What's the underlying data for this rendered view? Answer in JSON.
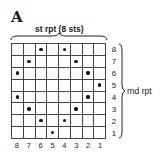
{
  "chart_label": "A",
  "stitch_repeat_label": "st rpt (8 sts)",
  "round_repeat_label": "rnd rpt",
  "columns": [
    "8",
    "7",
    "6",
    "5",
    "4",
    "3",
    "2",
    "1"
  ],
  "rows": [
    "8",
    "7",
    "6",
    "5",
    "4",
    "3",
    "2",
    "1"
  ],
  "dots": [
    [
      0,
      0,
      1,
      0,
      1,
      0,
      0,
      0
    ],
    [
      0,
      1,
      0,
      0,
      0,
      1,
      0,
      0
    ],
    [
      1,
      0,
      0,
      0,
      0,
      0,
      1,
      0
    ],
    [
      0,
      0,
      0,
      0,
      0,
      0,
      0,
      1
    ],
    [
      1,
      0,
      0,
      0,
      0,
      0,
      1,
      0
    ],
    [
      0,
      1,
      0,
      0,
      0,
      1,
      0,
      0
    ],
    [
      0,
      0,
      1,
      0,
      1,
      0,
      0,
      0
    ],
    [
      0,
      0,
      0,
      1,
      0,
      0,
      0,
      0
    ]
  ],
  "legend": {
    "dot": "purl stitch symbol"
  }
}
